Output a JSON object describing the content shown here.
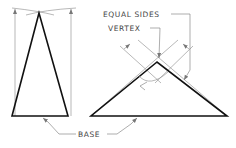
{
  "diagram": {
    "labels": {
      "equal_sides": "EQUAL SIDES",
      "vertex": "VERTEX",
      "base": "BASE"
    },
    "figures": [
      {
        "name": "tall-isosceles-triangle",
        "apex": [
          39,
          13
        ],
        "base_left": [
          12,
          116
        ],
        "base_right": [
          68,
          116
        ]
      },
      {
        "name": "wide-isosceles-triangle",
        "apex": [
          157,
          62
        ],
        "base_left": [
          91,
          116
        ],
        "base_right": [
          227,
          116
        ]
      }
    ],
    "colors": {
      "stroke": "#111111",
      "construction": "#888888",
      "text": "#444444",
      "background": "#ffffff"
    }
  }
}
